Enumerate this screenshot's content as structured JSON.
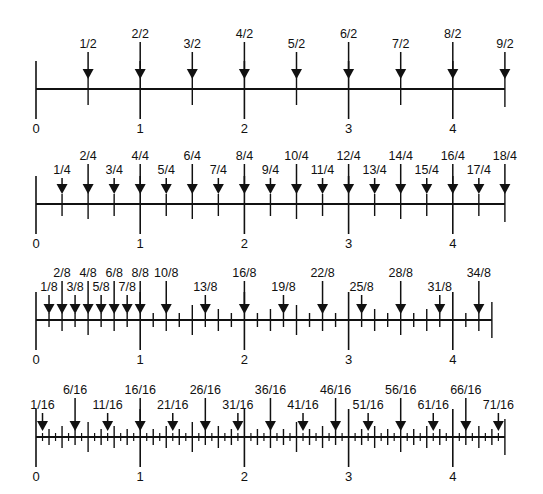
{
  "diagram": {
    "colors": {
      "ink": "#111111",
      "background": "#ffffff"
    },
    "x_start": 36,
    "unit_px": 104.2,
    "whole_labels": [
      "0",
      "1",
      "2",
      "3",
      "4"
    ],
    "lines": [
      {
        "name": "halves",
        "denominator": 2,
        "axis_y": 89,
        "end_value": 4.5,
        "marked_numerators": [
          1,
          2,
          3,
          4,
          5,
          6,
          7,
          8,
          9
        ],
        "arrow_labels": [
          "1/2",
          "2/2",
          "3/2",
          "4/2",
          "5/2",
          "6/2",
          "7/2",
          "8/2",
          "9/2"
        ],
        "label_low_y": 48,
        "label_high_y": 38
      },
      {
        "name": "fourths",
        "denominator": 4,
        "axis_y": 204,
        "end_value": 4.5,
        "marked_numerators": [
          1,
          2,
          3,
          4,
          5,
          6,
          7,
          8,
          9,
          10,
          11,
          12,
          13,
          14,
          15,
          16,
          17,
          18
        ],
        "arrow_labels": [
          "1/4",
          "2/4",
          "3/4",
          "4/4",
          "5/4",
          "6/4",
          "7/4",
          "8/4",
          "9/4",
          "10/4",
          "11/4",
          "12/4",
          "13/4",
          "14/4",
          "15/4",
          "16/4",
          "17/4",
          "18/4"
        ],
        "label_low_y": 174,
        "label_high_y": 160
      },
      {
        "name": "eighths",
        "denominator": 8,
        "axis_y": 320,
        "end_value": 4.375,
        "marked_numerators": [
          1,
          2,
          3,
          4,
          5,
          6,
          7,
          8,
          10,
          13,
          16,
          19,
          22,
          25,
          28,
          31,
          34
        ],
        "arrow_labels": [
          "1/8",
          "2/8",
          "3/8",
          "4/8",
          "5/8",
          "6/8",
          "7/8",
          "8/8",
          "10/8",
          "13/8",
          "16/8",
          "19/8",
          "22/8",
          "25/8",
          "28/8",
          "31/8",
          "34/8"
        ],
        "label_low_y": 291,
        "label_high_y": 277
      },
      {
        "name": "sixteenths",
        "denominator": 16,
        "axis_y": 437,
        "end_value": 4.5,
        "marked_numerators": [
          1,
          6,
          11,
          16,
          21,
          26,
          31,
          36,
          41,
          46,
          51,
          56,
          61,
          66,
          71
        ],
        "arrow_labels": [
          "1/16",
          "6/16",
          "11/16",
          "16/16",
          "21/16",
          "26/16",
          "31/16",
          "36/16",
          "41/16",
          "46/16",
          "51/16",
          "56/16",
          "61/16",
          "66/16",
          "71/16"
        ],
        "label_low_y": 409,
        "label_high_y": 394
      }
    ]
  }
}
